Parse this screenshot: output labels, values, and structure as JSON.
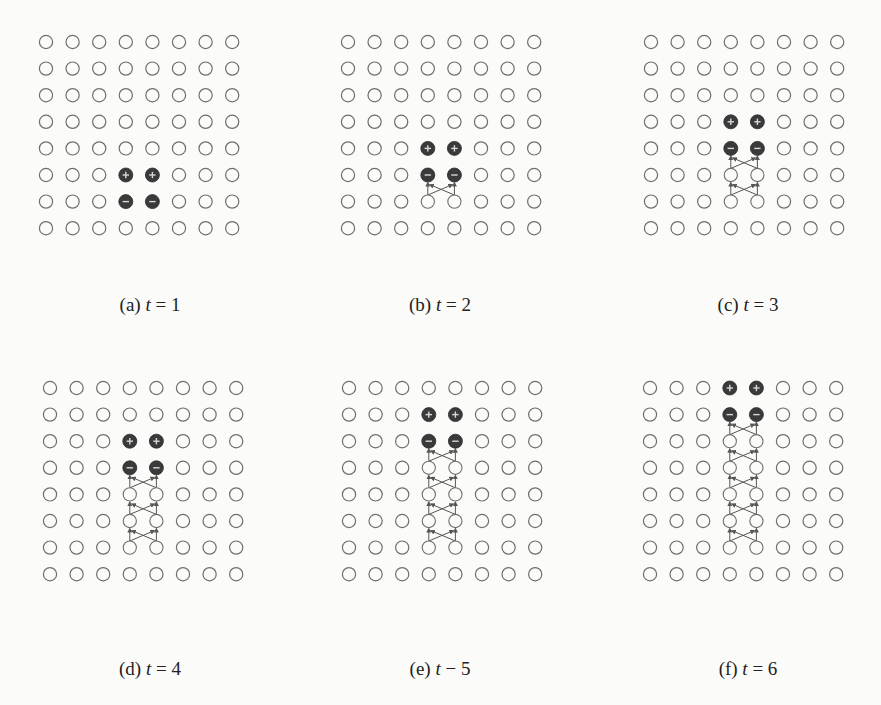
{
  "figure": {
    "grid": {
      "rows": 8,
      "cols": 8
    },
    "colors": {
      "empty_stroke": "#6e6e6e",
      "filled": "#3a3a3a",
      "arrow": "#555555",
      "sign": "#d8d8d8"
    },
    "panels": [
      {
        "id": "a",
        "label": "(a)",
        "var": "t",
        "op": " = ",
        "value": "1",
        "origin": [
          46,
          42
        ],
        "caption_pos": [
          150,
          306
        ],
        "plus": [
          [
            5,
            3
          ],
          [
            5,
            4
          ]
        ],
        "minus": [
          [
            6,
            3
          ],
          [
            6,
            4
          ]
        ],
        "chain_rows": []
      },
      {
        "id": "b",
        "label": "(b)",
        "var": "t",
        "op": " = ",
        "value": "2",
        "origin": [
          348,
          42
        ],
        "caption_pos": [
          440,
          306
        ],
        "plus": [
          [
            4,
            3
          ],
          [
            4,
            4
          ]
        ],
        "minus": [
          [
            5,
            3
          ],
          [
            5,
            4
          ]
        ],
        "chain_rows": [
          6
        ]
      },
      {
        "id": "c",
        "label": "(c)",
        "var": "t",
        "op": " = ",
        "value": "3",
        "origin": [
          651,
          42
        ],
        "caption_pos": [
          748,
          306
        ],
        "plus": [
          [
            3,
            3
          ],
          [
            3,
            4
          ]
        ],
        "minus": [
          [
            4,
            3
          ],
          [
            4,
            4
          ]
        ],
        "chain_rows": [
          5,
          6
        ]
      },
      {
        "id": "d",
        "label": "(d)",
        "var": "t",
        "op": " = ",
        "value": "4",
        "origin": [
          50,
          388
        ],
        "caption_pos": [
          150,
          670
        ],
        "plus": [
          [
            2,
            3
          ],
          [
            2,
            4
          ]
        ],
        "minus": [
          [
            3,
            3
          ],
          [
            3,
            4
          ]
        ],
        "chain_rows": [
          4,
          5,
          6
        ]
      },
      {
        "id": "e",
        "label": "(e)",
        "var": "t",
        "op": " − ",
        "value": "5",
        "origin": [
          349,
          388
        ],
        "caption_pos": [
          440,
          670
        ],
        "plus": [
          [
            1,
            3
          ],
          [
            1,
            4
          ]
        ],
        "minus": [
          [
            2,
            3
          ],
          [
            2,
            4
          ]
        ],
        "chain_rows": [
          3,
          4,
          5,
          6
        ]
      },
      {
        "id": "f",
        "label": "(f)",
        "var": "t",
        "op": " = ",
        "value": "6",
        "origin": [
          650,
          388
        ],
        "caption_pos": [
          748,
          670
        ],
        "plus": [
          [
            0,
            3
          ],
          [
            0,
            4
          ]
        ],
        "minus": [
          [
            1,
            3
          ],
          [
            1,
            4
          ]
        ],
        "chain_rows": [
          2,
          3,
          4,
          5,
          6
        ]
      }
    ],
    "spacing": 26.6,
    "radius": 6.6
  }
}
